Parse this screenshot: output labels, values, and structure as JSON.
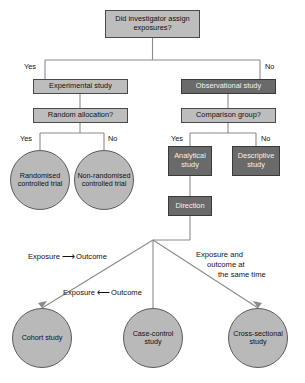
{
  "diagram": {
    "colors": {
      "light_box": "#bdbdbd",
      "dark_box": "#6a6a6a",
      "circle": "#b9b9b9",
      "line": "#7a7a7a",
      "text": "#111111"
    },
    "nodes": {
      "root": "Did investigator assign exposures?",
      "experimental": "Experimental study",
      "observational": "Observational study",
      "random_allocation": "Random allocation?",
      "comparison_group": "Comparison group?",
      "analytical": "Analytical study",
      "descriptive": "Descriptive study",
      "direction": "Direction",
      "randomised_trial": "Randomised controlled trial",
      "non_randomised_trial": "Non-randomised controlled trial",
      "cohort": "Cohort study",
      "case_control": "Case-control study",
      "cross_sectional": "Cross-sectional study"
    },
    "branch_labels": {
      "root_yes": "Yes",
      "root_no": "No",
      "random_yes": "Yes",
      "random_no": "No",
      "comparison_yes": "Yes",
      "comparison_no": "No"
    },
    "arrow_labels": {
      "cohort_exposure": "Exposure",
      "cohort_arrow": "⟶",
      "cohort_outcome": "Outcome",
      "case_control_exposure": "Exposure",
      "case_control_arrow": "⟵",
      "case_control_outcome": "Outcome",
      "cross_sectional_line1": "Exposure and",
      "cross_sectional_line2": "outcome at",
      "cross_sectional_line3": "the same time"
    }
  }
}
